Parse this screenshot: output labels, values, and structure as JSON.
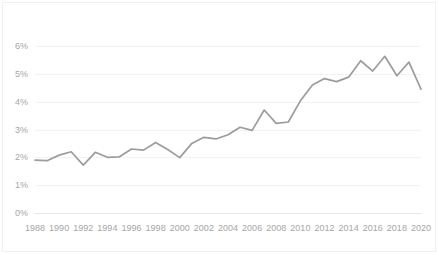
{
  "chart_data": {
    "type": "line",
    "title": "",
    "subtitle": "",
    "xlabel": "",
    "ylabel": "",
    "grid": "horizontal",
    "legend": "none",
    "xlim": [
      1988,
      2020
    ],
    "ylim": [
      0,
      6
    ],
    "ytick_labels": [
      "0%",
      "1%",
      "2%",
      "3%",
      "4%",
      "5%",
      "6%"
    ],
    "ytick_values": [
      0,
      1,
      2,
      3,
      4,
      5,
      6
    ],
    "xtick_labels": [
      "1988",
      "1990",
      "1992",
      "1994",
      "1996",
      "1998",
      "2000",
      "2002",
      "2004",
      "2006",
      "2008",
      "2010",
      "2012",
      "2014",
      "2016",
      "2018",
      "2020"
    ],
    "xtick_values": [
      1988,
      1990,
      1992,
      1994,
      1996,
      1998,
      2000,
      2002,
      2004,
      2006,
      2008,
      2010,
      2012,
      2014,
      2016,
      2018,
      2020
    ],
    "series": [
      {
        "name": "share",
        "color": "#9c9c9c",
        "x": [
          1988,
          1989,
          1990,
          1991,
          1992,
          1993,
          1994,
          1995,
          1996,
          1997,
          1998,
          1999,
          2000,
          2001,
          2002,
          2003,
          2004,
          2005,
          2006,
          2007,
          2008,
          2009,
          2010,
          2011,
          2012,
          2013,
          2014,
          2015,
          2016,
          2017,
          2018,
          2019,
          2020
        ],
        "values": [
          1.9,
          1.88,
          2.08,
          2.2,
          1.72,
          2.18,
          2.0,
          2.02,
          2.3,
          2.26,
          2.53,
          2.28,
          1.99,
          2.5,
          2.72,
          2.66,
          2.81,
          3.08,
          2.97,
          3.7,
          3.22,
          3.27,
          4.03,
          4.6,
          4.83,
          4.72,
          4.88,
          5.47,
          5.1,
          5.63,
          4.93,
          5.42,
          4.45
        ]
      }
    ],
    "ylabel_unit": "%",
    "axis_label_color": "#a6a6a6",
    "gridline_color": "#f2f2f2"
  }
}
